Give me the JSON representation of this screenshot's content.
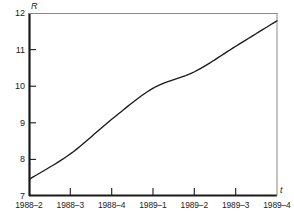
{
  "chart_data": {
    "type": "line",
    "title": "",
    "subtitle": "",
    "xlabel": "t",
    "ylabel": "R",
    "grid": false,
    "legend": "none",
    "categories": [
      "1988–2",
      "1988–3",
      "1988–4",
      "1989–1",
      "1989–2",
      "1989–3",
      "1989–4"
    ],
    "values": [
      7.45,
      8.15,
      9.1,
      9.95,
      10.4,
      11.1,
      11.8
    ],
    "series": [
      {
        "name": "R",
        "values": [
          7.45,
          8.15,
          9.1,
          9.95,
          10.4,
          11.1,
          11.8
        ]
      }
    ],
    "xlim": [
      0,
      6
    ],
    "ylim": [
      7,
      12
    ],
    "ytick_labels": [
      "7",
      "8",
      "9",
      "10",
      "11",
      "12"
    ],
    "ytick_values": [
      7,
      8,
      9,
      10,
      11,
      12
    ],
    "xtick_labels": [
      "1988–2",
      "1988–3",
      "1988–4",
      "1989–1",
      "1989–2",
      "1989–3",
      "1989–4"
    ],
    "line_color": "#1a1a1a",
    "axis_color": "#1a1a1a",
    "background_color": "#ffffff"
  },
  "axes": {
    "y_name": "R",
    "x_name": "t"
  },
  "ticks": {
    "y": [
      {
        "label": "12",
        "value": 12
      },
      {
        "label": "11",
        "value": 11
      },
      {
        "label": "10",
        "value": 10
      },
      {
        "label": "9",
        "value": 9
      },
      {
        "label": "8",
        "value": 8
      },
      {
        "label": "7",
        "value": 7
      }
    ],
    "x": [
      {
        "label": "1988–2",
        "index": 0
      },
      {
        "label": "1988–3",
        "index": 1
      },
      {
        "label": "1988–4",
        "index": 2
      },
      {
        "label": "1989–1",
        "index": 3
      },
      {
        "label": "1989–2",
        "index": 4
      },
      {
        "label": "1989–3",
        "index": 5
      },
      {
        "label": "1989–4",
        "index": 6
      }
    ]
  }
}
